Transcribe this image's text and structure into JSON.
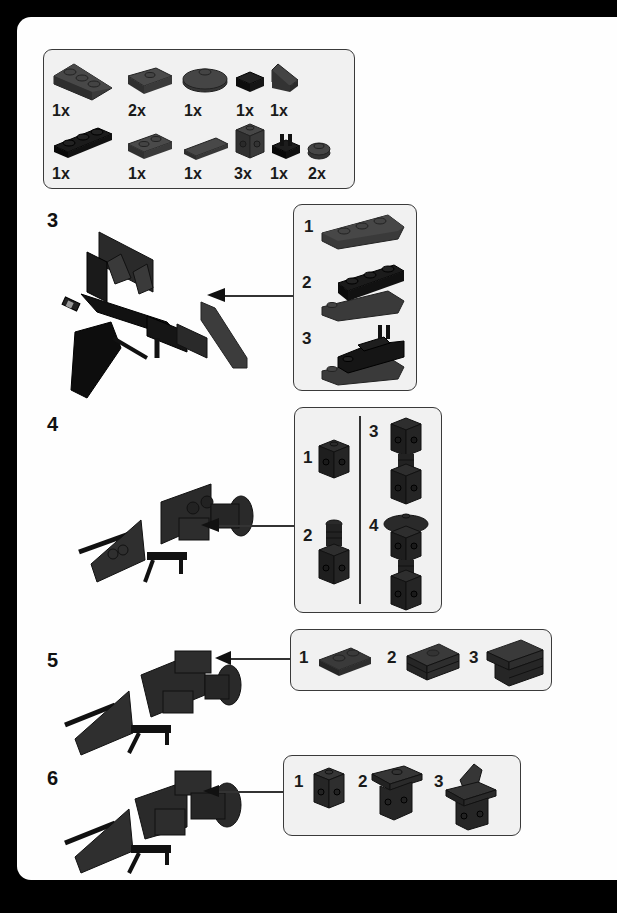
{
  "parts_list": {
    "items": [
      {
        "icon": "wedge-plate-3x2-icon",
        "qty": "1x"
      },
      {
        "icon": "plate-1x2-jumper-icon",
        "qty": "2x"
      },
      {
        "icon": "round-dish-2x2-icon",
        "qty": "1x"
      },
      {
        "icon": "tile-1x1-black-icon",
        "qty": "1x"
      },
      {
        "icon": "slope-1x1-icon",
        "qty": "1x"
      },
      {
        "icon": "plate-1x3-black-icon",
        "qty": "1x"
      },
      {
        "icon": "plate-1x2-icon",
        "qty": "1x"
      },
      {
        "icon": "tile-1x2-icon",
        "qty": "1x"
      },
      {
        "icon": "brick-1x1-studs-sides-icon",
        "qty": "3x"
      },
      {
        "icon": "plate-clip-black-icon",
        "qty": "1x"
      },
      {
        "icon": "round-plate-1x1-icon",
        "qty": "2x"
      }
    ]
  },
  "steps": [
    {
      "number": "3",
      "substeps": [
        {
          "number": "1",
          "icon": "wedge-plate-icon"
        },
        {
          "number": "2",
          "icon": "wedge-with-plate-icon"
        },
        {
          "number": "3",
          "icon": "wedge-with-clip-icon"
        }
      ]
    },
    {
      "number": "4",
      "substeps": [
        {
          "number": "1",
          "icon": "brick-1x1-studs-sides-icon"
        },
        {
          "number": "2",
          "icon": "brick-with-round-plates-icon"
        },
        {
          "number": "3",
          "icon": "stacked-bricks-icon"
        },
        {
          "number": "4",
          "icon": "stacked-bricks-dish-icon"
        }
      ]
    },
    {
      "number": "5",
      "substeps": [
        {
          "number": "1",
          "icon": "plate-1x2-icon"
        },
        {
          "number": "2",
          "icon": "plate-stack-jumper-icon"
        },
        {
          "number": "3",
          "icon": "plate-stack-tile-icon"
        }
      ]
    },
    {
      "number": "6",
      "substeps": [
        {
          "number": "1",
          "icon": "brick-1x1-studs-sides-icon"
        },
        {
          "number": "2",
          "icon": "brick-with-jumper-icon"
        },
        {
          "number": "3",
          "icon": "brick-with-slope-icon"
        }
      ]
    }
  ],
  "colors": {
    "page": "#fefefe",
    "panel": "#f1f1f1",
    "brick_grey": "#3d3d3d",
    "brick_black": "#151515",
    "outline": "#3a3a3a"
  }
}
